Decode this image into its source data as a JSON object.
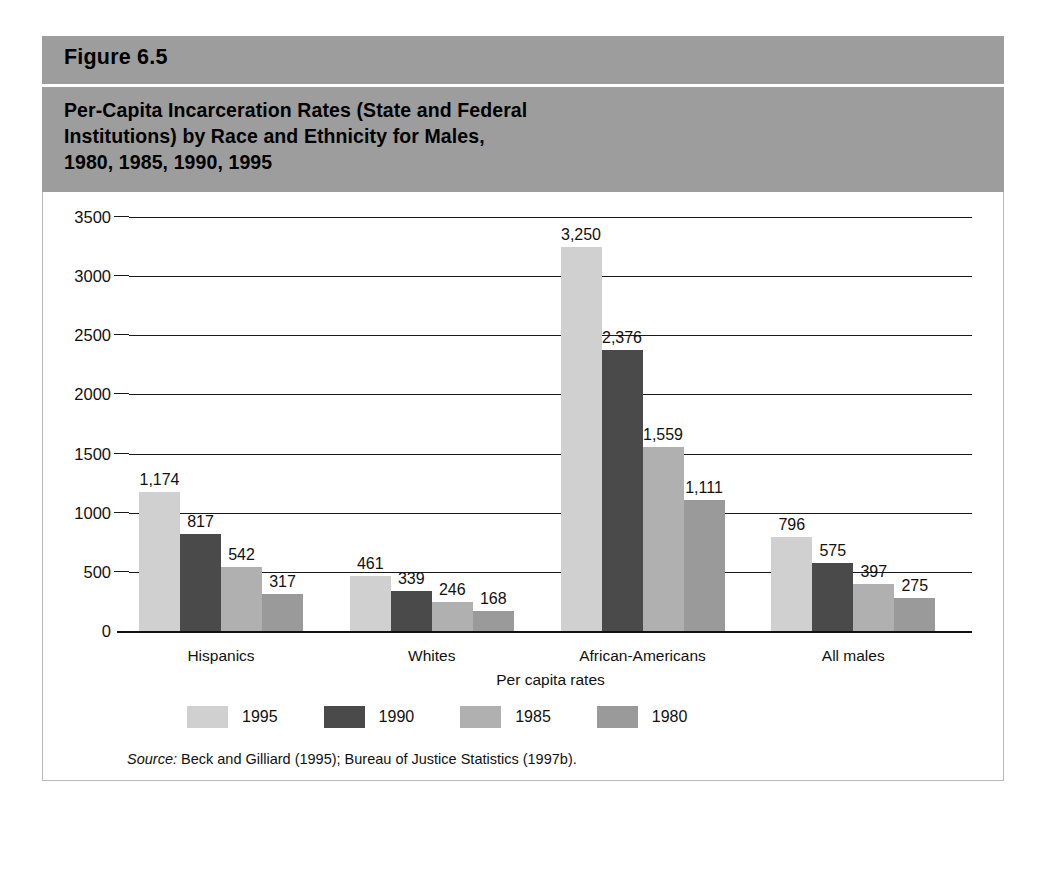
{
  "figure": {
    "label": "Figure 6.5",
    "title_lines": [
      "Per-Capita Incarceration Rates (State and Federal",
      "Institutions) by Race and Ethnicity for Males,",
      "1980, 1985, 1990, 1995"
    ],
    "source_keyword": "Source:",
    "source_text": " Beck and Gilliard (1995); Bureau of Justice Statistics (1997b)."
  },
  "colors": {
    "header_band": "#9d9d9d",
    "series_1995": "#d0d0d0",
    "series_1990": "#4a4a4a",
    "series_1985": "#b0b0b0",
    "series_1980": "#9a9a9a",
    "axis": "#111111",
    "panel_background": "#ffffff"
  },
  "chart_data": {
    "type": "bar",
    "title": "Per-Capita Incarceration Rates (State and Federal Institutions) by Race and Ethnicity for Males, 1980, 1985, 1990, 1995",
    "xlabel": "Per capita rates",
    "ylabel": "",
    "ylim": [
      0,
      3500
    ],
    "yticks": [
      0,
      500,
      1000,
      1500,
      2000,
      2500,
      3000,
      3500
    ],
    "ytick_labels": [
      "0",
      "500",
      "1000",
      "1500",
      "2000",
      "2500",
      "3000",
      "3500"
    ],
    "grid": true,
    "legend_position": "bottom-left",
    "categories": [
      "Hispanics",
      "Whites",
      "African-Americans",
      "All males"
    ],
    "series": [
      {
        "name": "1995",
        "color": "#d0d0d0",
        "values": [
          1174,
          461,
          3250,
          796
        ],
        "labels": [
          "1,174",
          "461",
          "3,250",
          "796"
        ]
      },
      {
        "name": "1990",
        "color": "#4a4a4a",
        "values": [
          817,
          339,
          2376,
          575
        ],
        "labels": [
          "817",
          "339",
          "2,376",
          "575"
        ]
      },
      {
        "name": "1985",
        "color": "#b0b0b0",
        "values": [
          542,
          246,
          1559,
          397
        ],
        "labels": [
          "542",
          "246",
          "1,559",
          "397"
        ]
      },
      {
        "name": "1980",
        "color": "#9a9a9a",
        "values": [
          317,
          168,
          1111,
          275
        ],
        "labels": [
          "317",
          "168",
          "1,111",
          "275"
        ]
      }
    ]
  }
}
